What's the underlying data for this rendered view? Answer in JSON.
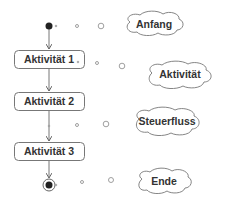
{
  "diagram": {
    "type": "UML activity diagram (legend)",
    "nodes": [
      {
        "id": "start",
        "kind": "initial-node"
      },
      {
        "id": "a1",
        "kind": "activity",
        "label": "Aktivität 1"
      },
      {
        "id": "a2",
        "kind": "activity",
        "label": "Aktivität 2"
      },
      {
        "id": "a3",
        "kind": "activity",
        "label": "Aktivität 3"
      },
      {
        "id": "end",
        "kind": "final-node"
      }
    ],
    "edges": [
      {
        "from": "start",
        "to": "a1"
      },
      {
        "from": "a1",
        "to": "a2"
      },
      {
        "from": "a2",
        "to": "a3"
      },
      {
        "from": "a3",
        "to": "end"
      }
    ],
    "callouts": [
      {
        "label": "Anfang",
        "points_to": "start"
      },
      {
        "label": "Aktivität",
        "points_to": "a1"
      },
      {
        "label": "Steuerfluss",
        "points_to": "a2-a3 edge"
      },
      {
        "label": "Ende",
        "points_to": "end"
      }
    ],
    "colors": {
      "stroke": "#666666",
      "text": "#333333",
      "node_fill": "#222222",
      "background": "#ffffff"
    }
  }
}
